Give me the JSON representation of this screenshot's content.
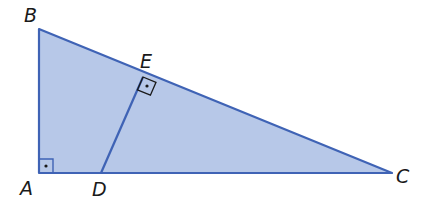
{
  "diagram": {
    "type": "geometry",
    "colors": {
      "fill": "#b7c8e8",
      "stroke": "#3f63b5",
      "label": "#1a1a1a"
    },
    "points": {
      "A": {
        "label": "A",
        "x": 39,
        "y": 173
      },
      "B": {
        "label": "B",
        "x": 39,
        "y": 29
      },
      "C": {
        "label": "C",
        "x": 392,
        "y": 173
      },
      "D": {
        "label": "D",
        "x": 101,
        "y": 173
      },
      "E": {
        "label": "E",
        "x": 143,
        "y": 77
      }
    },
    "segments": [
      [
        "A",
        "B"
      ],
      [
        "B",
        "C"
      ],
      [
        "C",
        "A"
      ],
      [
        "D",
        "E"
      ]
    ],
    "right_angles": [
      "A",
      "E"
    ]
  }
}
